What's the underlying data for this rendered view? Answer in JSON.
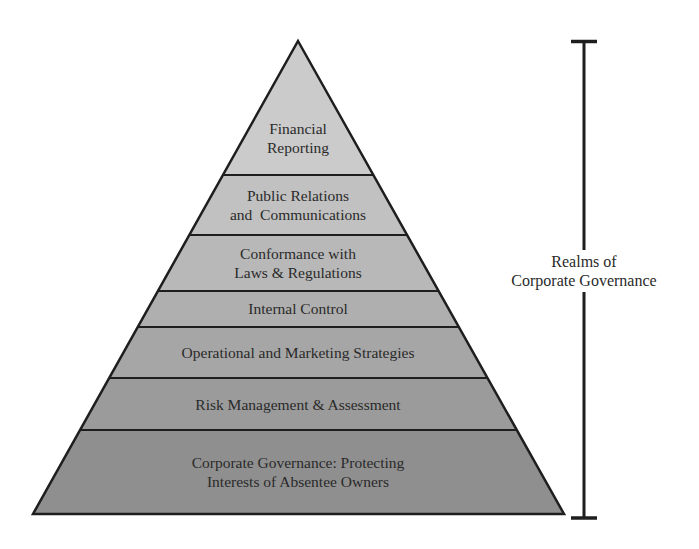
{
  "diagram": {
    "type": "pyramid",
    "layers": [
      {
        "label_line1": "Financial",
        "label_line2": "Reporting",
        "fill": "#cbcbcb"
      },
      {
        "label_line1": "Public Relations",
        "label_line2": "and  Communications",
        "fill": "#c1c1c1"
      },
      {
        "label_line1": "Conformance with",
        "label_line2": "Laws & Regulations",
        "fill": "#b8b8b8"
      },
      {
        "label_line1": "Internal Control",
        "label_line2": "",
        "fill": "#afafaf"
      },
      {
        "label_line1": "Operational and Marketing Strategies",
        "label_line2": "",
        "fill": "#a6a6a6"
      },
      {
        "label_line1": "Risk Management & Assessment",
        "label_line2": "",
        "fill": "#9b9b9b"
      },
      {
        "label_line1": "Corporate Governance: Protecting",
        "label_line2": "Interests of Absentee Owners",
        "fill": "#8f8f8f"
      }
    ],
    "bracket": {
      "label_line1": "Realms of",
      "label_line2": "Corporate Governance"
    },
    "colors": {
      "outline": "#1e1e1e",
      "text": "#2a2a2a",
      "background": "#ffffff"
    }
  }
}
